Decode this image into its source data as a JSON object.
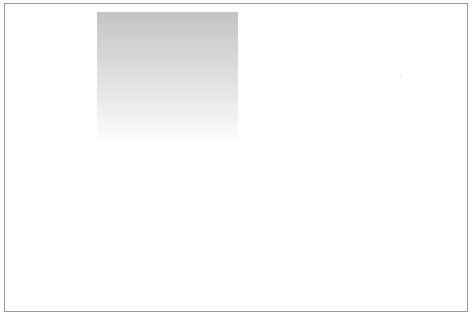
{
  "canvas": {
    "width": 473,
    "height": 318,
    "background": "#ffffff"
  },
  "frame": {
    "border_color": "#9a9a9a"
  },
  "gradient_box": {
    "top_color": "#c4c4c4",
    "mid_color": "#dedede",
    "bottom_color": "#ffffff"
  }
}
